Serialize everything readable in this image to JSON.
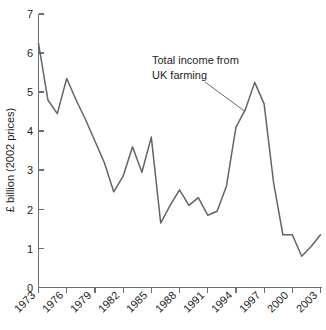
{
  "chart_data": {
    "type": "line",
    "title": "",
    "xlabel": "",
    "ylabel": "£ billion (2002 prices)",
    "xlim": [
      1973,
      2003
    ],
    "ylim": [
      0,
      7
    ],
    "grid": false,
    "legend": "none",
    "x_tick_labels": [
      "1973",
      "1976",
      "1979",
      "1982",
      "1985",
      "1988",
      "1991",
      "1994",
      "1997",
      "2000",
      "2003"
    ],
    "x_tick_values": [
      1973,
      1976,
      1979,
      1982,
      1985,
      1988,
      1991,
      1994,
      1997,
      2000,
      2003
    ],
    "y_tick_labels": [
      "0",
      "1",
      "2",
      "3",
      "4",
      "5",
      "6",
      "7"
    ],
    "y_tick_values": [
      0,
      1,
      2,
      3,
      4,
      5,
      6,
      7
    ],
    "annotations": [
      {
        "text_line1": "Total income from",
        "text_line2": "UK farming",
        "points_to_year": 1995,
        "points_to_value": 4.5
      }
    ],
    "series": [
      {
        "name": "Total income from UK farming",
        "color": "#636466",
        "x": [
          1973,
          1974,
          1975,
          1976,
          1977,
          1978,
          1979,
          1980,
          1981,
          1982,
          1983,
          1984,
          1985,
          1986,
          1987,
          1988,
          1989,
          1990,
          1991,
          1992,
          1993,
          1994,
          1995,
          1996,
          1997,
          1998,
          1999,
          2000,
          2001,
          2002,
          2003
        ],
        "values": [
          6.25,
          4.8,
          4.45,
          5.35,
          4.8,
          4.3,
          3.75,
          3.2,
          2.45,
          2.85,
          3.6,
          2.95,
          3.85,
          1.65,
          2.1,
          2.5,
          2.1,
          2.3,
          1.85,
          1.95,
          2.6,
          4.1,
          4.55,
          5.25,
          4.7,
          2.7,
          1.35,
          1.35,
          0.8,
          1.05,
          1.35
        ]
      }
    ]
  },
  "axis": {
    "y_title": "£ billion (2002 prices)"
  }
}
